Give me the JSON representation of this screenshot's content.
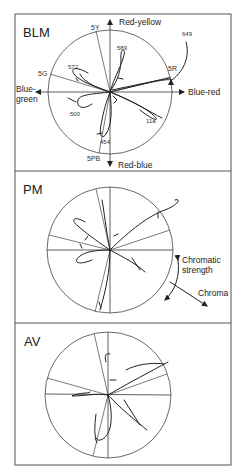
{
  "figure": {
    "panels": [
      {
        "id": "blm",
        "label": "BLM",
        "axis_labels": {
          "up": "Red-yellow",
          "right": "Blue-red",
          "left_line1": "Blue-",
          "left_line2": "green",
          "down": "Red-blue"
        },
        "hue_labels": [
          "5Y",
          "5G",
          "5R",
          "5PB"
        ],
        "wavelength_labels": [
          "649",
          "589",
          "572",
          "500",
          "11a",
          "454"
        ]
      },
      {
        "id": "pm",
        "label": "PM",
        "legend": {
          "chromatic_strength_line1": "Chromatic",
          "chromatic_strength_line2": "strength",
          "chroma": "Chroma"
        }
      },
      {
        "id": "av",
        "label": "AV"
      }
    ]
  }
}
